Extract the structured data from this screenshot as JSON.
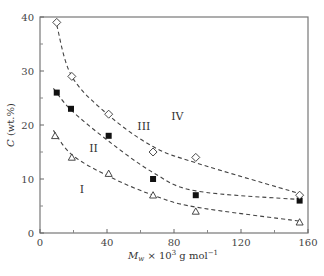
{
  "chart_data": {
    "type": "scatter",
    "title": "",
    "xlabel": "M_w × 10^3 g mol^-1",
    "ylabel": "C (wt.%)",
    "xlim": [
      0,
      160
    ],
    "ylim": [
      0,
      40
    ],
    "xticks": [
      0,
      40,
      80,
      120,
      160
    ],
    "yticks": [
      0,
      10,
      20,
      30,
      40
    ],
    "grid": false,
    "legend": "none",
    "series": [
      {
        "name": "boundary I/II (open triangles)",
        "marker": "triangle-open",
        "x": [
          9,
          19,
          41,
          67.5,
          93,
          155
        ],
        "y": [
          18,
          14,
          11,
          7,
          4,
          2
        ]
      },
      {
        "name": "boundary II/III (filled squares)",
        "marker": "square-filled",
        "x": [
          10,
          18.5,
          41,
          67.5,
          93,
          155
        ],
        "y": [
          26,
          23,
          18,
          10,
          7,
          6
        ]
      },
      {
        "name": "boundary III/IV (open diamonds)",
        "marker": "diamond-open",
        "x": [
          10,
          19,
          41,
          67.5,
          93,
          155
        ],
        "y": [
          39,
          29,
          22,
          15,
          14,
          7
        ]
      }
    ],
    "annotations": [
      {
        "text": "I",
        "x": 25,
        "y": 7.5
      },
      {
        "text": "II",
        "x": 32,
        "y": 15
      },
      {
        "text": "III",
        "x": 62,
        "y": 19
      },
      {
        "text": "IV",
        "x": 82,
        "y": 21
      }
    ]
  },
  "labels": {
    "ylabel_main": "C",
    "ylabel_unit": " (wt.%)",
    "xlabel_M": "M",
    "xlabel_sub": "w",
    "xlabel_rest": " × 10",
    "xlabel_exp": "3",
    "xlabel_unit": " g mol",
    "xlabel_unit_exp": "−1"
  }
}
